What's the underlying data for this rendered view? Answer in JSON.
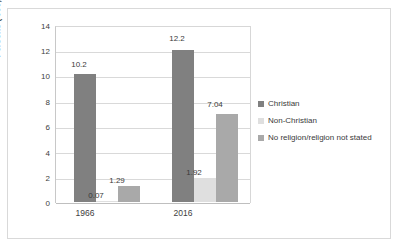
{
  "chart_data": {
    "type": "bar",
    "title": "",
    "xlabel": "",
    "ylabel": "Persons ('000,000s)",
    "ylim": [
      0,
      14
    ],
    "yticks": [
      "0",
      "2",
      "4",
      "6",
      "8",
      "10",
      "12",
      "14"
    ],
    "grid": true,
    "legend_position": "right",
    "categories": [
      "1966",
      "2016"
    ],
    "series": [
      {
        "name": "Christian",
        "color": "#808080",
        "values": [
          10.2,
          12.2
        ],
        "labels": [
          "10.2",
          "12.2"
        ]
      },
      {
        "name": "Non-Christian",
        "color": "#dfdfdf",
        "values": [
          0.07,
          1.92
        ],
        "labels": [
          "0.07",
          "1.92"
        ]
      },
      {
        "name": "No religion/religion not stated",
        "color": "#a9a9a9",
        "values": [
          1.29,
          7.04
        ],
        "labels": [
          "1.29",
          "7.04"
        ]
      }
    ]
  },
  "axis": {
    "y_title": "Persons ('000,000s)",
    "y_tick_0": "0",
    "y_tick_1": "2",
    "y_tick_2": "4",
    "y_tick_3": "6",
    "y_tick_4": "8",
    "y_tick_5": "10",
    "y_tick_6": "12",
    "y_tick_7": "14",
    "x_tick_0": "1966",
    "x_tick_1": "2016"
  },
  "legend": {
    "items": [
      {
        "label": "Christian",
        "color": "#808080"
      },
      {
        "label": "Non-Christian",
        "color": "#dfdfdf"
      },
      {
        "label": "No religion/religion not stated",
        "color": "#a9a9a9"
      }
    ]
  },
  "bar_labels": {
    "g1s1": "10.2",
    "g1s2": "0.07",
    "g1s3": "1.29",
    "g2s1": "12.2",
    "g2s2": "1.92",
    "g2s3": "7.04"
  }
}
